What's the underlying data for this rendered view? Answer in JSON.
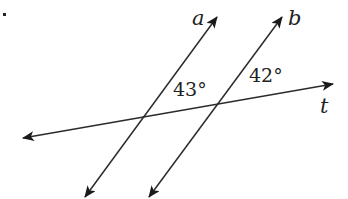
{
  "diagram": {
    "type": "parallel-lines-with-transversal",
    "lines": [
      {
        "id": "a",
        "label": "a",
        "x1": 85,
        "y1": 197,
        "x2": 217,
        "y2": 17,
        "arrows": "both"
      },
      {
        "id": "b",
        "label": "b",
        "x1": 149,
        "y1": 197,
        "x2": 282,
        "y2": 17,
        "arrows": "both"
      },
      {
        "id": "t",
        "label": "t",
        "x1": 23,
        "y1": 138,
        "x2": 333,
        "y2": 84,
        "arrows": "both"
      }
    ],
    "labels": {
      "line_a": "a",
      "line_b": "b",
      "line_t": "t",
      "angle_1": "43°",
      "angle_2": "42°"
    },
    "angles": [
      {
        "value": "43°",
        "at_intersection": "a-t",
        "position": "above transversal, right of line a"
      },
      {
        "value": "42°",
        "at_intersection": "b-t",
        "position": "above transversal, right of line b"
      }
    ],
    "colors": {
      "line": "#2b2b2b",
      "text": "#222222",
      "background": "#ffffff"
    }
  }
}
